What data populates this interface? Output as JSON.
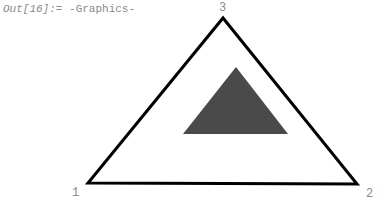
{
  "cell": {
    "prompt": "Out[16]:=",
    "result": "-Graphics-"
  },
  "graphic": {
    "outer_triangle": {
      "points": [
        [
          88,
          183
        ],
        [
          357,
          184
        ],
        [
          223,
          18
        ]
      ],
      "stroke": "#000000",
      "fill": "#ffffff"
    },
    "inner_triangle": {
      "points": [
        [
          183,
          134
        ],
        [
          288,
          134
        ],
        [
          236,
          67
        ]
      ],
      "fill": "#4a4a4a"
    },
    "vertex_labels": [
      {
        "text": "1",
        "x": 72,
        "y": 196
      },
      {
        "text": "2",
        "x": 366,
        "y": 197
      },
      {
        "text": "3",
        "x": 219,
        "y": 11
      }
    ]
  }
}
